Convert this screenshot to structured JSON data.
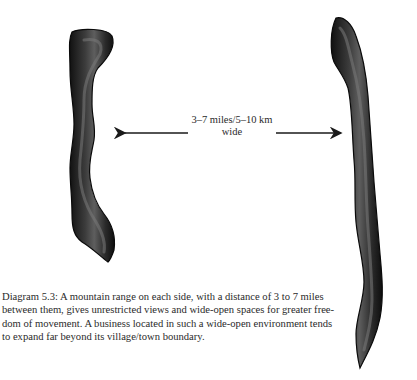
{
  "figure": {
    "title": "Diagram 5.3",
    "distance_label_line1": "3–7 miles/5–10 km",
    "distance_label_line2": "wide",
    "left_feature": "mountain range",
    "right_feature": "mountain range",
    "arrows": [
      "left-pointing arrow",
      "right-pointing arrow"
    ],
    "colors": {
      "mountain_dark": "#141414",
      "mountain_mid": "#3a3a3a",
      "mountain_highlight": "#6e6e6e",
      "arrow": "#1a1a1a",
      "text": "#2a2a2a"
    }
  },
  "caption": {
    "lines": [
      "Diagram 5.3: A mountain range on each side, with a distance of 3 to 7 miles",
      "between them, gives unrestricted views and wide-open spaces for greater free-",
      "dom of movement. A business located in such a wide-open environment tends",
      "to expand far beyond its village/town boundary."
    ]
  }
}
